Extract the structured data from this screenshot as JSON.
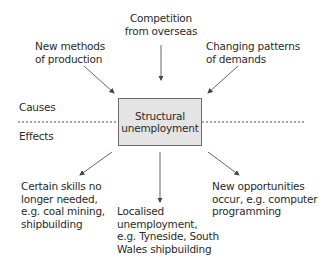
{
  "diagram": {
    "center": "Structural\nunemployment",
    "regions": {
      "causes": "Causes",
      "effects": "Effects"
    },
    "causes": [
      {
        "id": "new-methods",
        "text": "New methods\nof production"
      },
      {
        "id": "competition",
        "text": "Competition\nfrom overseas"
      },
      {
        "id": "changing-patterns",
        "text": "Changing patterns\nof demands"
      }
    ],
    "effects": [
      {
        "id": "skills-not-needed",
        "text": "Certain skills no\nlonger needed,\ne.g. coal mining,\nshipbuilding"
      },
      {
        "id": "localised",
        "text": "Localised\nunemployment,\ne.g. Tyneside, South\nWales shipbuilding"
      },
      {
        "id": "new-opportunities",
        "text": "New opportunities\noccur, e.g. computer\nprogramming"
      }
    ],
    "colors": {
      "box_fill": "#e4e4e4",
      "box_border": "#6a6a6a",
      "arrow": "#555555",
      "divider": "#555555"
    }
  }
}
